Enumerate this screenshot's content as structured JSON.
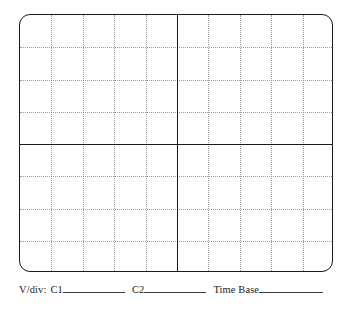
{
  "figure": {
    "name": "oscilloscope-graticule-worksheet",
    "screen": {
      "divisions_horizontal": 10,
      "divisions_vertical": 8,
      "border_color": "#1a1a1a",
      "gridline_color": "#9a9a9a",
      "axis_color": "#1a1a1a",
      "background_color": "#ffffff"
    }
  },
  "caption": {
    "vdiv_label": "V/div:",
    "channel1_label": "C1",
    "channel1_value": "",
    "channel2_label": "C2",
    "channel2_value": "",
    "timebase_label": "Time Base",
    "timebase_value": ""
  }
}
